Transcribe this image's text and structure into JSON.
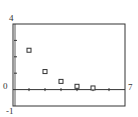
{
  "chart_data": {
    "type": "scatter",
    "title": "",
    "xlabel": "",
    "ylabel": "",
    "xlim": [
      0,
      7
    ],
    "ylim": [
      -1,
      4
    ],
    "grid": false,
    "legend": null,
    "x_ticks": [
      1,
      2,
      3,
      4,
      5,
      6
    ],
    "y_ticks": [
      1,
      2,
      3
    ],
    "axis_labels": {
      "x_max": "7",
      "y_max": "4",
      "y_min": "-1",
      "origin": "0"
    },
    "marker": "hollow-square",
    "series": [
      {
        "name": "points",
        "x": [
          1,
          2,
          3,
          4,
          5
        ],
        "y": [
          2.4,
          1.1,
          0.5,
          0.2,
          0.1
        ]
      }
    ]
  },
  "colors": {
    "axis": "#333333",
    "marker": "#333333",
    "background": "#ffffff"
  }
}
